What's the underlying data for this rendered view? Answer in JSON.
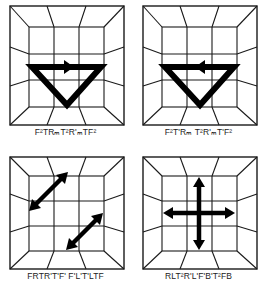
{
  "figure": {
    "panels": [
      {
        "id": "top-left",
        "caption_parts": [
          [
            "F",
            "2"
          ],
          [
            "T",
            ""
          ],
          [
            "R",
            "m"
          ],
          [
            "T",
            "2"
          ],
          [
            "R'",
            "m"
          ],
          [
            "T",
            ""
          ],
          [
            "F",
            "2"
          ]
        ],
        "caption": "F²TRₘT²R'ₘTF²",
        "marker": "triangle-arrow-right"
      },
      {
        "id": "top-right",
        "caption": "F²T'Rₘ T²R'ₘT'F²",
        "marker": "triangle-arrow-left"
      },
      {
        "id": "bottom-left",
        "caption": "FRTR'T'F' F'L'T'LTF",
        "marker": "two-diagonal-double-arrows"
      },
      {
        "id": "bottom-right",
        "caption": "RLT²R'L'F'B'T²FB",
        "marker": "cross-four-arrows"
      }
    ],
    "colors": {
      "line": "#1a1a1a",
      "arrow": "#000000",
      "background": "#ffffff"
    }
  }
}
